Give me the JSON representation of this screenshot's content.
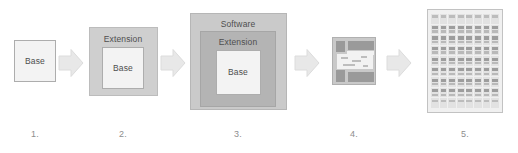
{
  "diagram": {
    "colors": {
      "background": "#ffffff",
      "base_fill": "#f3f3f3",
      "base_border": "#adadad",
      "extension_fill": "#cfcfcf",
      "software_fill": "#cacaca",
      "arrow_fill": "#e8e8e8",
      "arrow_stroke": "#dcdcdc",
      "caption_text": "#8e8e8e",
      "label_text": "#4e4e4e",
      "die_body": "#c9c9c9",
      "die_pad": "#9a9a9a",
      "die_core": "#f2f2f2",
      "wafer_fill": "#f0f0f0",
      "wafer_cell": "#e2e2e2"
    },
    "stages": [
      {
        "caption": "1.",
        "kind": "boxes",
        "labels": {
          "base": "Base"
        }
      },
      {
        "caption": "2.",
        "kind": "boxes",
        "labels": {
          "extension": "Extension",
          "base": "Base"
        }
      },
      {
        "caption": "3.",
        "kind": "boxes",
        "labels": {
          "software": "Software",
          "extension": "Extension",
          "base": "Base"
        }
      },
      {
        "caption": "4.",
        "kind": "chip-die",
        "labels": {}
      },
      {
        "caption": "5.",
        "kind": "wafer",
        "labels": {},
        "grid": {
          "columns": 8,
          "rows": 9
        }
      }
    ],
    "arrows": [
      {
        "name": "arrow-1-to-2"
      },
      {
        "name": "arrow-2-to-3"
      },
      {
        "name": "arrow-3-to-4"
      },
      {
        "name": "arrow-4-to-5"
      }
    ]
  }
}
